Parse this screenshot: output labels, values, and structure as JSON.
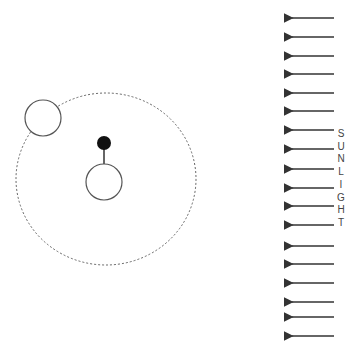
{
  "diagram": {
    "label_letters": [
      "S",
      "U",
      "N",
      "L",
      "I",
      "G",
      "H",
      "T"
    ],
    "label_word": "SUNLIGHT",
    "arrow_count": 18,
    "arrow_direction": "left",
    "elements": {
      "orbit": "dashed circular orbit",
      "moon": "small circle on orbit (upper-left)",
      "earth": "central circle",
      "observer": "black dot on stick atop earth"
    },
    "colors": {
      "stroke": "#333333",
      "orbit": "#666666",
      "dot": "#111111",
      "text": "#444444"
    }
  }
}
